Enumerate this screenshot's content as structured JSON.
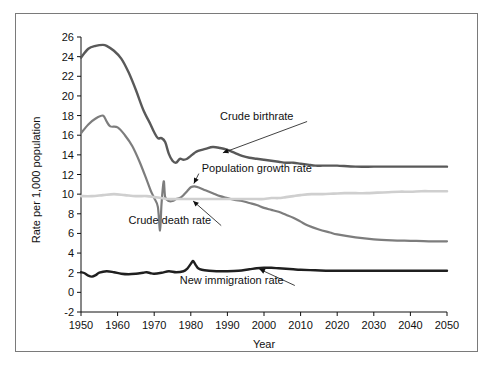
{
  "chart_data": {
    "type": "line",
    "title": "",
    "xlabel": "Year",
    "ylabel": "Rate per 1,000 population",
    "xlim": [
      1950,
      2050
    ],
    "ylim": [
      -2,
      26
    ],
    "xticks": [
      1950,
      1960,
      1970,
      1980,
      1990,
      2000,
      2010,
      2020,
      2030,
      2040,
      2050
    ],
    "yticks": [
      -2,
      0,
      2,
      4,
      6,
      8,
      10,
      12,
      14,
      16,
      18,
      20,
      22,
      24,
      26
    ],
    "grid": false,
    "legend_position": "inline-annotations",
    "series": [
      {
        "name": "Crude birthrate",
        "color": "#595959",
        "width": 2.4,
        "label_x": 1988,
        "label_y": 17.6,
        "anchor_x": 1988,
        "anchor_y": 14.1,
        "x": [
          1950,
          1952,
          1954,
          1956,
          1957,
          1959,
          1961,
          1963,
          1965,
          1967,
          1969,
          1970,
          1971,
          1972,
          1973,
          1974,
          1975,
          1976,
          1977,
          1978,
          1979,
          1980,
          1981,
          1982,
          1984,
          1986,
          1988,
          1990,
          1992,
          1994,
          1996,
          1998,
          2000,
          2002,
          2004,
          2006,
          2008,
          2010,
          2012,
          2014,
          2016,
          2018,
          2020,
          2025,
          2030,
          2035,
          2040,
          2045,
          2050
        ],
        "y": [
          23.9,
          24.8,
          25.1,
          25.2,
          25.1,
          24.6,
          23.8,
          22.4,
          20.6,
          18.6,
          17.1,
          16.3,
          15.7,
          15.7,
          15.3,
          14.1,
          13.4,
          13.2,
          13.6,
          13.5,
          13.6,
          13.9,
          14.2,
          14.4,
          14.6,
          14.8,
          14.7,
          14.5,
          14.2,
          13.9,
          13.7,
          13.6,
          13.5,
          13.4,
          13.3,
          13.2,
          13.2,
          13.1,
          13.0,
          12.9,
          12.9,
          12.9,
          12.9,
          12.8,
          12.8,
          12.8,
          12.8,
          12.8,
          12.8
        ]
      },
      {
        "name": "Population growth rate",
        "color": "#7d7d7d",
        "width": 2.2,
        "label_x": 1983,
        "label_y": 12.3,
        "anchor_x": 1980.5,
        "anchor_y": 10.8,
        "x": [
          1950,
          1952,
          1954,
          1956,
          1957,
          1958,
          1960,
          1962,
          1964,
          1966,
          1968,
          1969,
          1970,
          1971,
          1971.6,
          1972,
          1972.6,
          1973,
          1974,
          1975,
          1976,
          1977,
          1978,
          1979,
          1980,
          1981,
          1982,
          1984,
          1986,
          1988,
          1990,
          1992,
          1994,
          1996,
          1998,
          2000,
          2002,
          2004,
          2006,
          2008,
          2010,
          2012,
          2015,
          2018,
          2020,
          2025,
          2030,
          2035,
          2040,
          2045,
          2050
        ],
        "y": [
          16.2,
          17.1,
          17.7,
          18.0,
          17.4,
          16.9,
          16.8,
          16.0,
          14.9,
          13.3,
          11.4,
          10.4,
          9.6,
          8.7,
          6.3,
          9.0,
          11.3,
          9.7,
          9.3,
          9.3,
          9.5,
          9.6,
          9.9,
          10.3,
          10.7,
          10.8,
          10.7,
          10.4,
          10.1,
          9.8,
          9.6,
          9.4,
          9.3,
          9.1,
          8.9,
          8.6,
          8.4,
          8.2,
          7.9,
          7.6,
          7.2,
          6.8,
          6.4,
          6.1,
          5.9,
          5.6,
          5.4,
          5.3,
          5.25,
          5.2,
          5.2
        ]
      },
      {
        "name": "Crude death rate",
        "color": "#cfcfcf",
        "width": 2.6,
        "label_x": 1963,
        "label_y": 7.0,
        "anchor_x": 1980,
        "anchor_y": 9.5,
        "x": [
          1950,
          1953,
          1956,
          1959,
          1962,
          1965,
          1968,
          1970,
          1972,
          1974,
          1976,
          1978,
          1980,
          1983,
          1986,
          1989,
          1992,
          1995,
          1998,
          2000,
          2002,
          2004,
          2006,
          2008,
          2010,
          2013,
          2016,
          2019,
          2022,
          2025,
          2028,
          2031,
          2034,
          2037,
          2040,
          2043,
          2046,
          2050
        ],
        "y": [
          9.8,
          9.8,
          9.9,
          10.0,
          9.9,
          9.8,
          9.8,
          9.7,
          9.6,
          9.5,
          9.5,
          9.5,
          9.5,
          9.5,
          9.5,
          9.5,
          9.5,
          9.5,
          9.5,
          9.5,
          9.6,
          9.6,
          9.7,
          9.8,
          9.9,
          10.0,
          10.0,
          10.05,
          10.1,
          10.1,
          10.1,
          10.15,
          10.2,
          10.25,
          10.25,
          10.3,
          10.3,
          10.3
        ]
      },
      {
        "name": "New immigration rate",
        "color": "#1f1f1f",
        "width": 2.4,
        "label_x": 1977,
        "label_y": 0.9,
        "anchor_x": 1998,
        "anchor_y": 2.5,
        "x": [
          1950,
          1951,
          1952,
          1953,
          1954,
          1955,
          1957,
          1959,
          1961,
          1963,
          1965,
          1967,
          1968,
          1969,
          1970,
          1972,
          1974,
          1976,
          1978,
          1979,
          1980,
          1980.6,
          1981,
          1981.5,
          1982,
          1983,
          1985,
          1987,
          1990,
          1993,
          1996,
          1998,
          2000,
          2002,
          2004,
          2006,
          2008,
          2010,
          2014,
          2018,
          2022,
          2026,
          2030,
          2035,
          2040,
          2045,
          2050
        ],
        "y": [
          2.05,
          1.95,
          1.7,
          1.6,
          1.75,
          2.0,
          2.15,
          2.05,
          1.9,
          1.85,
          1.9,
          2.0,
          2.05,
          1.95,
          1.9,
          2.0,
          2.15,
          2.05,
          2.15,
          2.4,
          2.9,
          3.2,
          3.0,
          2.7,
          2.45,
          2.3,
          2.2,
          2.15,
          2.15,
          2.2,
          2.35,
          2.45,
          2.5,
          2.5,
          2.45,
          2.4,
          2.35,
          2.3,
          2.25,
          2.2,
          2.2,
          2.2,
          2.2,
          2.2,
          2.2,
          2.2,
          2.2
        ]
      }
    ]
  },
  "axis": {
    "ylabel": "Rate per 1,000 population",
    "xlabel": "Year"
  }
}
